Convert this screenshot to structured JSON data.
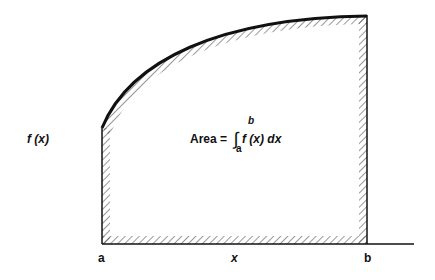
{
  "diagram": {
    "y_label": "f (x)",
    "x_label": "x",
    "lower_bound_label": "a",
    "upper_bound_label": "b",
    "formula": {
      "prefix": "Area = ",
      "integral_sign": "∫",
      "upper_limit": "b",
      "lower_limit": "a",
      "integrand": "f (x) dx"
    },
    "colors": {
      "stroke": "#111111",
      "background": "#ffffff"
    }
  }
}
